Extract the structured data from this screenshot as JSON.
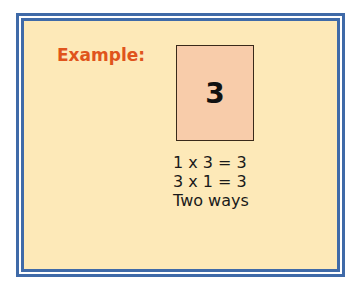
{
  "example": {
    "label": "Example:",
    "card_value": "3",
    "lines": [
      "1 x 3 = 3",
      "3 x 1 = 3",
      "Two ways"
    ]
  },
  "colors": {
    "border": "#3f6aa8",
    "background": "#fde9b8",
    "label": "#e0541c",
    "card_fill": "#f8ccaa"
  }
}
